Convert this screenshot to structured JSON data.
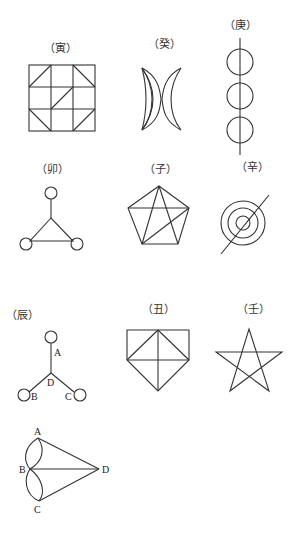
{
  "figures": [
    {
      "id": "yin",
      "label": "（寅）",
      "description": "3x3 square grid with diagonal lines"
    },
    {
      "id": "gui",
      "label": "（癸）",
      "description": "two overlapping crescents"
    },
    {
      "id": "geng",
      "label": "（庚）",
      "description": "three circles on a vertical line"
    },
    {
      "id": "mao",
      "label": "（卯）",
      "description": "triangle with a circle at each vertex"
    },
    {
      "id": "zi",
      "label": "（子）",
      "description": "pentagon with internal diagonals"
    },
    {
      "id": "xin",
      "label": "（辛）",
      "description": "three concentric circles crossed by a diagonal line"
    },
    {
      "id": "chen",
      "label": "（辰）",
      "description": "three-branch star with circles at ends",
      "points": [
        "A",
        "B",
        "C",
        "D"
      ]
    },
    {
      "id": "chou",
      "label": "（丑）",
      "description": "house-shaped pentagon with diagonals"
    },
    {
      "id": "ren",
      "label": "（壬）",
      "description": "five-pointed star"
    },
    {
      "id": "last",
      "label": "",
      "description": "lens-shaped arcs A-B, B-C with lines to D",
      "points": [
        "A",
        "B",
        "C",
        "D"
      ]
    }
  ],
  "colors": {
    "stroke": "#333333",
    "background": "#ffffff"
  }
}
